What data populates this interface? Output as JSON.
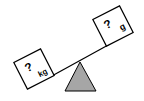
{
  "diagram": {
    "type": "balance-scale",
    "left_box": {
      "symbol": "?",
      "unit": "kg"
    },
    "right_box": {
      "symbol": "?",
      "unit": "g"
    },
    "fulcrum_color": "#a6a6a6",
    "stroke_color": "#000000",
    "tilt": "left-side-down"
  }
}
